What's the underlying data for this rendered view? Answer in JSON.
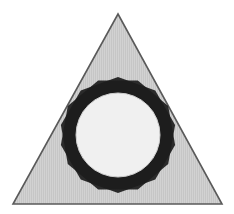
{
  "canvas": {
    "width": 234,
    "height": 214,
    "background_color": "#ffffff"
  },
  "figure": {
    "title": "Inscribed nine-pointed star and circle within a triangle"
  },
  "colors": {
    "background": "#ffffff",
    "triangle_fill": "#c6c6c6",
    "triangle_stroke": "#5a5a5a",
    "triangle_hatch_line": "#d6d6d6",
    "star_fill": "#1c1c1c",
    "star_overlap_fill": "#8d8d8d",
    "circle_fill": "#f0f0f0",
    "circle_stroke": "#cfcfcf"
  },
  "shapes": {
    "triangle": {
      "name": "triangle",
      "type": "polygon",
      "sides": 3,
      "fill": "#c6c6c6",
      "stroke": "#5a5a5a",
      "stroke_width": 1.6,
      "points": [
        {
          "x": 118,
          "y": 14
        },
        {
          "x": 222,
          "y": 204
        },
        {
          "x": 13,
          "y": 204
        }
      ]
    },
    "star": {
      "name": "nine-pointed-star",
      "type": "compound-polygon",
      "points_count": 9,
      "fill": "#1c1c1c",
      "center": {
        "x": 118,
        "y": 135
      },
      "outer_radius": 58,
      "polygon_a": {
        "name": "nonagon-a",
        "sides": 9,
        "radius": 58,
        "rotation_deg": -90
      },
      "polygon_b": {
        "name": "nonagon-b",
        "sides": 9,
        "radius": 58,
        "rotation_deg": -70
      }
    },
    "circle": {
      "name": "inscribed-circle",
      "type": "circle",
      "fill": "#f0f0f0",
      "stroke": "#cfcfcf",
      "stroke_width": 1,
      "center": {
        "x": 118,
        "y": 135
      },
      "radius": 42
    }
  }
}
